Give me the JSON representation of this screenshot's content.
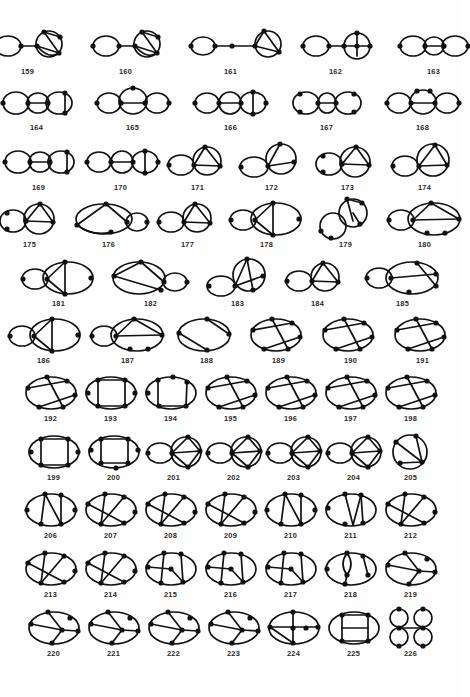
{
  "figure": {
    "kind": "graph-catalog",
    "background_color": "#fefefe",
    "stroke_color": "#111111",
    "label_color": "#2a2a2a",
    "first_label": "159",
    "last_label": "226",
    "total_diagrams": 68,
    "rows": [
      {
        "index": 0,
        "top": 26,
        "gap": 26,
        "items": [
          {
            "label": "159",
            "w": 72,
            "h": 40,
            "type": "lollipop-two-lobe"
          },
          {
            "label": "160",
            "w": 72,
            "h": 40,
            "type": "lollipop-two-lobe"
          },
          {
            "label": "161",
            "w": 86,
            "h": 40,
            "type": "chain-dot-lobe"
          },
          {
            "label": "162",
            "w": 72,
            "h": 40,
            "type": "lollipop-bar-lobe"
          },
          {
            "label": "163",
            "w": 72,
            "h": 40,
            "type": "triple-lobe"
          }
        ]
      },
      {
        "index": 1,
        "top": 84,
        "gap": 22,
        "items": [
          {
            "label": "164",
            "w": 72,
            "h": 38,
            "type": "triple-lobe-chord"
          },
          {
            "label": "165",
            "w": 76,
            "h": 38,
            "type": "triple-lobe-top-vertex"
          },
          {
            "label": "166",
            "w": 76,
            "h": 38,
            "type": "triple-lobe-quad"
          },
          {
            "label": "167",
            "w": 72,
            "h": 38,
            "type": "triple-lobe-side"
          },
          {
            "label": "168",
            "w": 76,
            "h": 38,
            "type": "triple-lobe-arc"
          }
        ]
      },
      {
        "index": 2,
        "top": 142,
        "gap": 10,
        "items": [
          {
            "label": "169",
            "w": 72,
            "h": 40,
            "type": "triple-lobe-chord"
          },
          {
            "label": "170",
            "w": 72,
            "h": 40,
            "type": "triple-lobe-quad"
          },
          {
            "label": "171",
            "w": 62,
            "h": 40,
            "type": "double-lobe-chord"
          },
          {
            "label": "172",
            "w": 66,
            "h": 40,
            "type": "double-lobe-offset"
          },
          {
            "label": "173",
            "w": 66,
            "h": 40,
            "type": "double-lobe-tri"
          },
          {
            "label": "174",
            "w": 68,
            "h": 40,
            "type": "double-lobe-diag"
          }
        ]
      },
      {
        "index": 3,
        "top": 199,
        "gap": 10,
        "items": [
          {
            "label": "175",
            "w": 62,
            "h": 40,
            "type": "double-lobe-tri"
          },
          {
            "label": "176",
            "w": 76,
            "h": 40,
            "type": "wide-lobe-arc"
          },
          {
            "label": "177",
            "w": 62,
            "h": 40,
            "type": "double-lobe-chord"
          },
          {
            "label": "178",
            "w": 76,
            "h": 40,
            "type": "lobe-ellipse-bar"
          },
          {
            "label": "179",
            "w": 62,
            "h": 40,
            "type": "offset-lobes"
          },
          {
            "label": "180",
            "w": 76,
            "h": 40,
            "type": "lobe-ellipse-chords"
          }
        ]
      },
      {
        "index": 4,
        "top": 258,
        "gap": 14,
        "items": [
          {
            "label": "181",
            "w": 76,
            "h": 40,
            "type": "lobe-ellipse-bar"
          },
          {
            "label": "182",
            "w": 80,
            "h": 40,
            "type": "ellipse-lobe-chords"
          },
          {
            "label": "183",
            "w": 66,
            "h": 40,
            "type": "offset-lobes-diag"
          },
          {
            "label": "184",
            "w": 66,
            "h": 40,
            "type": "double-lobe-chord"
          },
          {
            "label": "185",
            "w": 76,
            "h": 40,
            "type": "lobe-ellipse-diag"
          }
        ]
      },
      {
        "index": 5,
        "top": 315,
        "gap": 10,
        "items": [
          {
            "label": "186",
            "w": 72,
            "h": 40,
            "type": "lobe-ellipse-bar"
          },
          {
            "label": "187",
            "w": 76,
            "h": 40,
            "type": "lobe-ellipse-chords"
          },
          {
            "label": "188",
            "w": 62,
            "h": 40,
            "type": "ellipse-theta"
          },
          {
            "label": "189",
            "w": 62,
            "h": 40,
            "type": "ellipse-chords"
          },
          {
            "label": "190",
            "w": 62,
            "h": 40,
            "type": "ellipse-chords"
          },
          {
            "label": "191",
            "w": 62,
            "h": 40,
            "type": "ellipse-chords"
          }
        ]
      },
      {
        "index": 6,
        "top": 373,
        "gap": 4,
        "items": [
          {
            "label": "192",
            "w": 56,
            "h": 40,
            "type": "ellipse-chords"
          },
          {
            "label": "193",
            "w": 56,
            "h": 40,
            "type": "ellipse-rect"
          },
          {
            "label": "194",
            "w": 56,
            "h": 40,
            "type": "ellipse-rect-top"
          },
          {
            "label": "195",
            "w": 56,
            "h": 40,
            "type": "ellipse-chords"
          },
          {
            "label": "196",
            "w": 56,
            "h": 40,
            "type": "ellipse-chords"
          },
          {
            "label": "197",
            "w": 56,
            "h": 40,
            "type": "ellipse-chords"
          },
          {
            "label": "198",
            "w": 56,
            "h": 40,
            "type": "ellipse-chords"
          }
        ]
      },
      {
        "index": 7,
        "top": 432,
        "gap": 4,
        "items": [
          {
            "label": "199",
            "w": 56,
            "h": 40,
            "type": "ellipse-rect"
          },
          {
            "label": "200",
            "w": 56,
            "h": 40,
            "type": "ellipse-rect-bot"
          },
          {
            "label": "201",
            "w": 56,
            "h": 40,
            "type": "double-lobe-fan"
          },
          {
            "label": "202",
            "w": 56,
            "h": 40,
            "type": "double-lobe-fan"
          },
          {
            "label": "203",
            "w": 56,
            "h": 40,
            "type": "double-lobe-fan"
          },
          {
            "label": "204",
            "w": 56,
            "h": 40,
            "type": "double-lobe-fan"
          },
          {
            "label": "205",
            "w": 50,
            "h": 40,
            "type": "circle-diag"
          }
        ]
      },
      {
        "index": 8,
        "top": 490,
        "gap": 4,
        "items": [
          {
            "label": "206",
            "w": 56,
            "h": 40,
            "type": "ellipse-verticals"
          },
          {
            "label": "207",
            "w": 56,
            "h": 40,
            "type": "ellipse-diag"
          },
          {
            "label": "208",
            "w": 56,
            "h": 40,
            "type": "ellipse-diag"
          },
          {
            "label": "209",
            "w": 56,
            "h": 40,
            "type": "ellipse-diag"
          },
          {
            "label": "210",
            "w": 56,
            "h": 40,
            "type": "ellipse-verticals"
          },
          {
            "label": "211",
            "w": 56,
            "h": 40,
            "type": "ellipse-vee"
          },
          {
            "label": "212",
            "w": 56,
            "h": 40,
            "type": "ellipse-diag"
          }
        ]
      },
      {
        "index": 9,
        "top": 549,
        "gap": 4,
        "items": [
          {
            "label": "213",
            "w": 56,
            "h": 40,
            "type": "ellipse-diag"
          },
          {
            "label": "214",
            "w": 56,
            "h": 40,
            "type": "ellipse-diag"
          },
          {
            "label": "215",
            "w": 56,
            "h": 40,
            "type": "ellipse-diag-mid"
          },
          {
            "label": "216",
            "w": 56,
            "h": 40,
            "type": "ellipse-diag-mid"
          },
          {
            "label": "217",
            "w": 56,
            "h": 40,
            "type": "ellipse-diag-mid"
          },
          {
            "label": "218",
            "w": 56,
            "h": 40,
            "type": "ellipse-lens"
          },
          {
            "label": "219",
            "w": 56,
            "h": 40,
            "type": "ellipse-fan"
          }
        ]
      },
      {
        "index": 10,
        "top": 608,
        "gap": 4,
        "items": [
          {
            "label": "220",
            "w": 56,
            "h": 40,
            "type": "ellipse-fan"
          },
          {
            "label": "221",
            "w": 56,
            "h": 40,
            "type": "ellipse-fan"
          },
          {
            "label": "222",
            "w": 56,
            "h": 40,
            "type": "ellipse-fan"
          },
          {
            "label": "223",
            "w": 56,
            "h": 40,
            "type": "ellipse-fan"
          },
          {
            "label": "224",
            "w": 56,
            "h": 40,
            "type": "ellipse-cross"
          },
          {
            "label": "225",
            "w": 56,
            "h": 40,
            "type": "ellipse-ladder"
          },
          {
            "label": "226",
            "w": 50,
            "h": 40,
            "type": "four-circles"
          }
        ]
      }
    ]
  }
}
